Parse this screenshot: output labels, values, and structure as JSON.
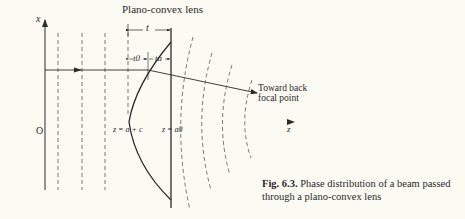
{
  "diagram": {
    "title": "Plano-convex lens",
    "axis_x_label": "x",
    "axis_z_label": "z",
    "origin_label": "O",
    "thickness_label": "t",
    "t0_label": "t0",
    "ta_label": "ta",
    "vertex_label": "z = a + c",
    "flat_side_label": "z = a0",
    "ray_annotation_line1": "Toward back",
    "ray_annotation_line2": "focal point",
    "colors": {
      "background": "#fbfaf3",
      "ink": "#2a2a2a",
      "axis_left": "#d9534f",
      "axis_mid": "#4a7a9a"
    }
  },
  "caption": {
    "fig_label": "Fig. 6.3.",
    "text": "Phase distribution of a beam passed through a plano-convex lens"
  }
}
